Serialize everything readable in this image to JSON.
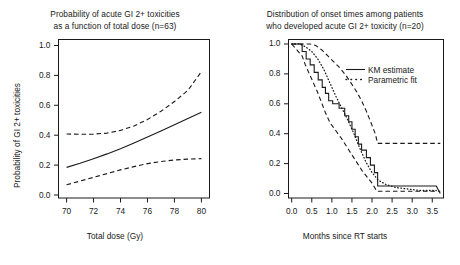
{
  "figure": {
    "background_color": "#ffffff",
    "line_color": "#1a1a1a",
    "panel_count": 2
  },
  "chart_data": [
    {
      "id": "left-panel",
      "type": "line",
      "title": "Probability of acute GI 2+ toxicities\nas a function of total dose (n=63)",
      "title_line1": "Probability of acute GI 2+ toxicities",
      "title_line2": "as a function of total dose (n=63)",
      "xlabel": "Total dose (Gy)",
      "ylabel": "Probability of GI 2+ toxicities",
      "xlim": [
        69.4,
        80.6
      ],
      "ylim": [
        -0.02,
        1.04
      ],
      "xticks": [
        70,
        72,
        74,
        76,
        78,
        80
      ],
      "xtick_labels": [
        "70",
        "72",
        "74",
        "76",
        "78",
        "80"
      ],
      "yticks": [
        0.0,
        0.2,
        0.4,
        0.6,
        0.8,
        1.0
      ],
      "ytick_labels": [
        "0.0",
        "0.2",
        "0.4",
        "0.6",
        "0.8",
        "1.0"
      ],
      "grid": false,
      "legend": null,
      "series": [
        {
          "name": "fitted probability",
          "style": "solid",
          "x": [
            70,
            71,
            72,
            73,
            74,
            75,
            76,
            77,
            78,
            79,
            80
          ],
          "values": [
            0.185,
            0.212,
            0.243,
            0.275,
            0.31,
            0.348,
            0.388,
            0.428,
            0.47,
            0.512,
            0.553
          ]
        },
        {
          "name": "upper 95% confidence limit",
          "style": "dashed",
          "x": [
            70,
            71,
            72,
            73,
            74,
            75,
            76,
            77,
            78,
            79,
            80
          ],
          "values": [
            0.408,
            0.406,
            0.407,
            0.414,
            0.432,
            0.462,
            0.505,
            0.56,
            0.625,
            0.7,
            0.825
          ]
        },
        {
          "name": "lower 95% confidence limit",
          "style": "dashed",
          "x": [
            70,
            71,
            72,
            73,
            74,
            75,
            76,
            77,
            78,
            79,
            80
          ],
          "values": [
            0.068,
            0.093,
            0.118,
            0.143,
            0.168,
            0.19,
            0.21,
            0.224,
            0.234,
            0.24,
            0.243
          ]
        }
      ]
    },
    {
      "id": "right-panel",
      "type": "line",
      "title": "Distribution of onset times among patients\nwho developed acute GI 2+ toxicity (n=20)",
      "title_line1": "Distribution of onset times among patients",
      "title_line2": "who developed acute GI 2+ toxicity (n=20)",
      "xlabel": "Months since RT starts",
      "ylabel": "1 Probability of GI 2+ toxicity",
      "xlim": [
        -0.08,
        3.78
      ],
      "ylim": [
        -0.03,
        1.03
      ],
      "xticks": [
        0.0,
        0.5,
        1.0,
        1.5,
        2.0,
        2.5,
        3.0,
        3.5
      ],
      "xtick_labels": [
        "0.0",
        "0.5",
        "1.0",
        "1.5",
        "2.0",
        "2.5",
        "3.0",
        "3.5"
      ],
      "yticks": [
        0.0,
        0.2,
        0.4,
        0.6,
        0.8,
        1.0
      ],
      "ytick_labels": [
        "0.0",
        "0.2",
        "0.4",
        "0.6",
        "0.8",
        "1.0"
      ],
      "grid": false,
      "legend": {
        "position": "top-right",
        "entries": [
          {
            "label": "KM estimate",
            "style": "solid"
          },
          {
            "label": "Parametric fit",
            "style": "dotted"
          }
        ]
      },
      "series": [
        {
          "name": "KM estimate",
          "style": "solid-step",
          "x": [
            0.0,
            0.26,
            0.26,
            0.36,
            0.36,
            0.46,
            0.46,
            0.56,
            0.56,
            0.66,
            0.66,
            0.76,
            0.76,
            0.84,
            0.84,
            0.92,
            0.92,
            1.02,
            1.02,
            1.18,
            1.18,
            1.32,
            1.32,
            1.42,
            1.42,
            1.5,
            1.5,
            1.58,
            1.58,
            1.66,
            1.66,
            1.74,
            1.74,
            1.86,
            1.86,
            1.96,
            1.96,
            2.06,
            2.06,
            2.14,
            2.14,
            3.6,
            3.6,
            3.7
          ],
          "values": [
            1.0,
            1.0,
            0.95,
            0.95,
            0.9,
            0.9,
            0.86,
            0.86,
            0.81,
            0.81,
            0.76,
            0.76,
            0.71,
            0.71,
            0.67,
            0.67,
            0.62,
            0.62,
            0.6,
            0.6,
            0.57,
            0.57,
            0.52,
            0.52,
            0.48,
            0.48,
            0.43,
            0.43,
            0.38,
            0.38,
            0.33,
            0.33,
            0.29,
            0.29,
            0.24,
            0.24,
            0.19,
            0.19,
            0.14,
            0.14,
            0.05,
            0.05,
            0.05,
            0.0
          ]
        },
        {
          "name": "Parametric fit",
          "style": "dotted",
          "x": [
            0.0,
            0.2,
            0.35,
            0.5,
            0.65,
            0.8,
            0.95,
            1.1,
            1.25,
            1.4,
            1.55,
            1.7,
            1.85,
            2.0,
            2.15,
            2.35,
            2.6,
            2.9,
            3.2,
            3.6
          ],
          "values": [
            1.0,
            1.0,
            0.98,
            0.95,
            0.9,
            0.83,
            0.74,
            0.65,
            0.57,
            0.49,
            0.4,
            0.3,
            0.21,
            0.14,
            0.09,
            0.06,
            0.04,
            0.03,
            0.02,
            0.02
          ]
        },
        {
          "name": "upper confidence band",
          "style": "dashed",
          "x": [
            0.0,
            0.3,
            0.45,
            0.6,
            0.75,
            0.9,
            1.05,
            1.2,
            1.35,
            1.5,
            1.62,
            1.74,
            1.86,
            1.98,
            2.08,
            2.14,
            2.6,
            3.1,
            3.7
          ],
          "values": [
            1.0,
            1.0,
            1.0,
            0.99,
            0.96,
            0.92,
            0.88,
            0.84,
            0.79,
            0.73,
            0.68,
            0.62,
            0.55,
            0.47,
            0.4,
            0.335,
            0.335,
            0.335,
            0.335
          ]
        },
        {
          "name": "lower confidence band",
          "style": "dashed",
          "x": [
            0.0,
            0.26,
            0.34,
            0.44,
            0.54,
            0.64,
            0.74,
            0.84,
            0.96,
            1.1,
            1.26,
            1.4,
            1.52,
            1.64,
            1.76,
            1.88,
            2.0,
            2.12,
            2.6,
            3.1,
            3.7
          ],
          "values": [
            1.0,
            0.92,
            0.86,
            0.8,
            0.74,
            0.68,
            0.61,
            0.54,
            0.47,
            0.42,
            0.36,
            0.3,
            0.25,
            0.2,
            0.15,
            0.11,
            0.07,
            0.015,
            0.015,
            0.015,
            0.015
          ]
        }
      ]
    }
  ]
}
